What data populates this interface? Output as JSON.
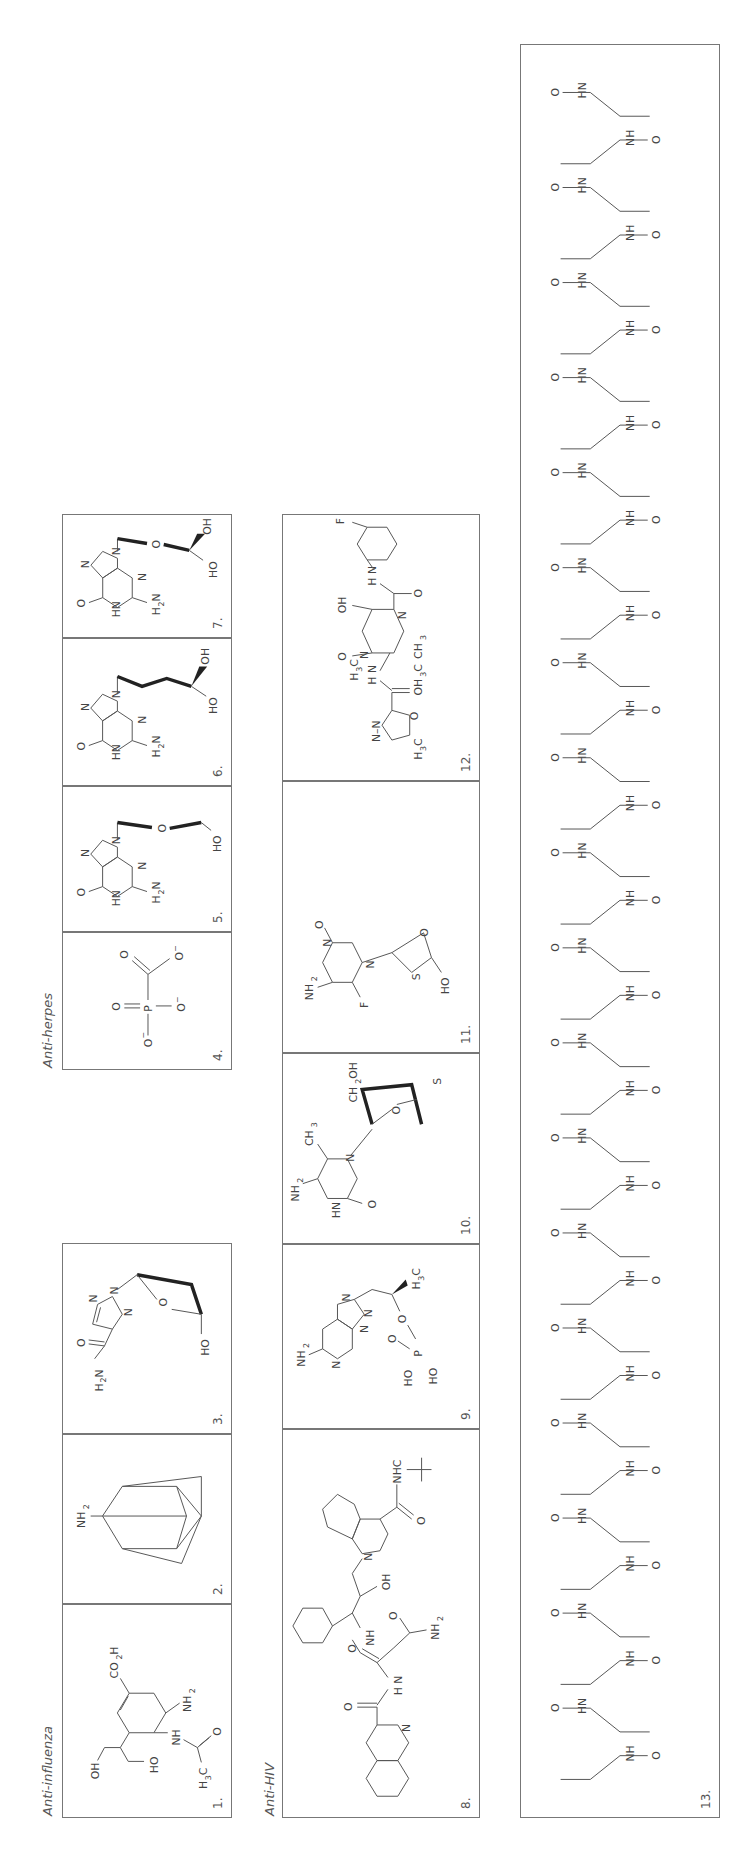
{
  "figure": {
    "orientation": "rotated 90deg counter-clockwise",
    "groups": [
      {
        "id": "anti-influenza",
        "label": "Anti-influenza"
      },
      {
        "id": "anti-herpes",
        "label": "Anti-herpes"
      },
      {
        "id": "anti-hiv",
        "label": "Anti-HIV"
      }
    ],
    "compounds": [
      {
        "number": "1.",
        "group": "anti-influenza",
        "labels": [
          "CO2H",
          "OH",
          "HO",
          "NH",
          "NH2",
          "H3C",
          "O"
        ]
      },
      {
        "number": "2.",
        "group": "anti-influenza",
        "labels": [
          "NH2"
        ]
      },
      {
        "number": "3.",
        "group": "anti-influenza",
        "labels": [
          "O",
          "H2N",
          "N",
          "N",
          "N",
          "O",
          "HO"
        ]
      },
      {
        "number": "4.",
        "group": "anti-herpes",
        "labels": [
          "O",
          "O",
          "P",
          "O-",
          "O-",
          "O-"
        ]
      },
      {
        "number": "5.",
        "group": "anti-herpes",
        "labels": [
          "O",
          "HN",
          "N",
          "N",
          "N",
          "H2N",
          "O",
          "HO"
        ]
      },
      {
        "number": "6.",
        "group": "anti-herpes",
        "labels": [
          "O",
          "HN",
          "N",
          "N",
          "N",
          "H2N",
          "HO",
          "OH"
        ]
      },
      {
        "number": "7.",
        "group": "anti-herpes",
        "labels": [
          "O",
          "HN",
          "N",
          "N",
          "N",
          "H2N",
          "O",
          "HO",
          "OH"
        ]
      },
      {
        "number": "8.",
        "group": "anti-hiv",
        "labels": [
          "N",
          "O",
          "H N",
          "O",
          "NH",
          "O",
          "NH2",
          "OH",
          "N",
          "O",
          "NHC"
        ]
      },
      {
        "number": "9.",
        "group": "anti-hiv",
        "labels": [
          "NH2",
          "N",
          "N",
          "N",
          "N",
          "O",
          "HO",
          "HO",
          "P",
          "O",
          "H3C"
        ]
      },
      {
        "number": "10.",
        "group": "anti-hiv",
        "labels": [
          "NH2",
          "CH3",
          "HN",
          "N",
          "O",
          "O",
          "S",
          "CH2OH"
        ]
      },
      {
        "number": "11.",
        "group": "anti-hiv",
        "labels": [
          "NH2",
          "F",
          "N",
          "N",
          "O",
          "S",
          "O",
          "HO"
        ]
      },
      {
        "number": "12.",
        "group": "anti-hiv",
        "labels": [
          "F",
          "OH",
          "O",
          "H N",
          "O",
          "N",
          "H3C",
          "N",
          "H N",
          "CH3",
          "OH3C",
          "N–N",
          "O",
          "H3C"
        ]
      },
      {
        "number": "13.",
        "group": "anti-hiv",
        "labels": [
          "peptide (Ac-Tyr-Thr-Ser-Leu-Ile-His-Ser-Leu-Ile-Glu-Glu-Ser-Gln-Asn-Gln-Gln-Glu-Lys-Asn-Glu-Gln-Glu-Leu-Leu-Glu-Leu-Asp-Lys-Trp-Ala-Ser-Leu-Trp-Asn-Trp-Phe-NH2)"
        ]
      }
    ]
  },
  "text": {
    "group_influenza": "Anti-influenza",
    "group_herpes": "Anti-herpes",
    "group_hiv": "Anti-HIV",
    "n1": "1.",
    "n2": "2.",
    "n3": "3.",
    "n4": "4.",
    "n5": "5.",
    "n6": "6.",
    "n7": "7.",
    "n8": "8.",
    "n9": "9.",
    "n10": "10.",
    "n11": "11.",
    "n12": "12.",
    "n13": "13."
  }
}
